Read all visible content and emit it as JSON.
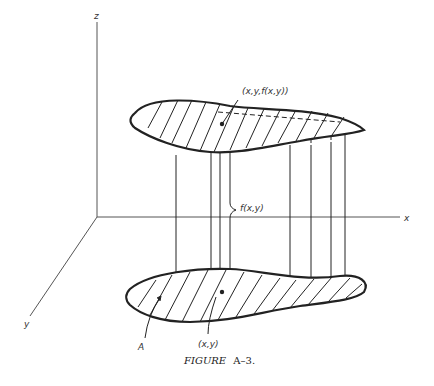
{
  "figure": {
    "caption_prefix": "FIGURE",
    "caption_number": "A–3.",
    "axes": {
      "z_label": "z",
      "x_label": "x",
      "y_label": "y"
    },
    "labels": {
      "surface_point": "(x,y,f(x,y))",
      "height": "f(x,y)",
      "base_point": "(x,y)",
      "region": "A"
    },
    "colors": {
      "ink": "#222222",
      "axis": "#555555",
      "background": "#ffffff"
    }
  }
}
